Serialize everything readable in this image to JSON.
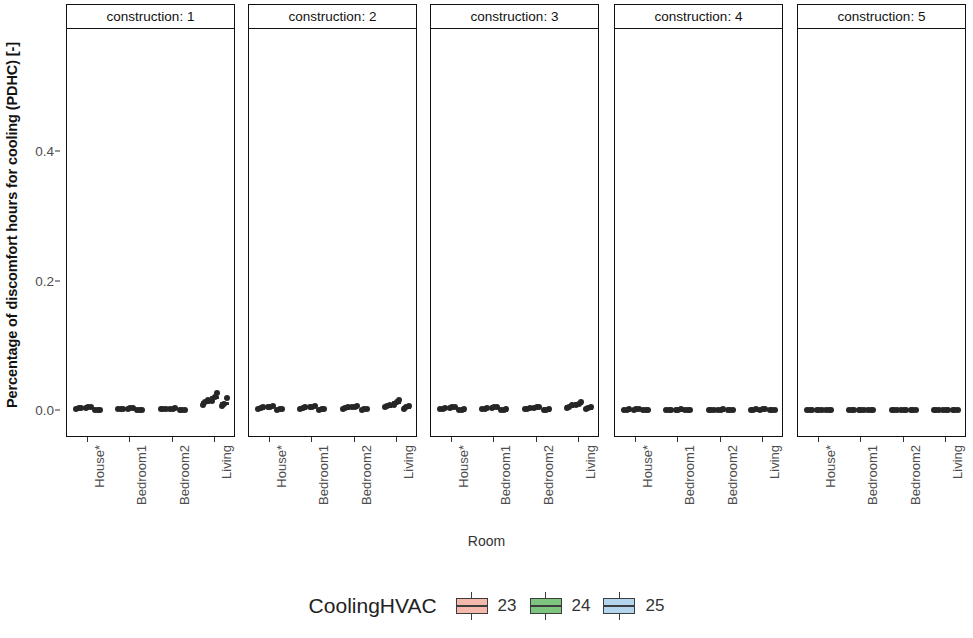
{
  "chart_data": {
    "type": "scatter",
    "title": "",
    "xlabel": "Room",
    "ylabel": "Percentage of discomfort hours for cooling (PDHC) [-]",
    "ylim": [
      -0.02,
      0.52
    ],
    "yticks": [
      0.0,
      0.2,
      0.4
    ],
    "ytick_labels": [
      "0.0",
      "0.2",
      "0.4"
    ],
    "categories": [
      "House*",
      "Bedroom1",
      "Bedroom2",
      "Living"
    ],
    "grid": false,
    "facet_variable": "construction",
    "facet_labels": [
      "construction: 1",
      "construction: 2",
      "construction: 3",
      "construction: 4",
      "construction: 5"
    ],
    "legend": {
      "title": "CoolingHVAC",
      "position": "bottom",
      "entries": [
        {
          "label": "23",
          "color": "#f4b8ac"
        },
        {
          "label": "24",
          "color": "#7dc47f"
        },
        {
          "label": "25",
          "color": "#b3d5ee"
        }
      ]
    },
    "panels": [
      {
        "facet": "construction: 1",
        "groups": [
          {
            "category": "House*",
            "series": [
              {
                "name": "23",
                "values": [
                  0.002,
                  0.003,
                  0.003
                ]
              },
              {
                "name": "24",
                "values": [
                  0.003,
                  0.004,
                  0.004
                ]
              },
              {
                "name": "25",
                "values": [
                  0.0,
                  0.0,
                  0.0
                ]
              }
            ]
          },
          {
            "category": "Bedroom1",
            "series": [
              {
                "name": "23",
                "values": [
                  0.001,
                  0.002,
                  0.002
                ]
              },
              {
                "name": "24",
                "values": [
                  0.002,
                  0.003,
                  0.003
                ]
              },
              {
                "name": "25",
                "values": [
                  0.0,
                  0.0,
                  0.0
                ]
              }
            ]
          },
          {
            "category": "Bedroom2",
            "series": [
              {
                "name": "23",
                "values": [
                  0.001,
                  0.001,
                  0.002
                ]
              },
              {
                "name": "24",
                "values": [
                  0.002,
                  0.002,
                  0.003
                ]
              },
              {
                "name": "25",
                "values": [
                  0.0,
                  0.0,
                  0.0
                ]
              }
            ]
          },
          {
            "category": "Living",
            "series": [
              {
                "name": "23",
                "values": [
                  0.008,
                  0.012,
                  0.016
                ]
              },
              {
                "name": "24",
                "values": [
                  0.014,
                  0.02,
                  0.026
                ]
              },
              {
                "name": "25",
                "values": [
                  0.006,
                  0.01,
                  0.018
                ]
              }
            ]
          }
        ]
      },
      {
        "facet": "construction: 2",
        "groups": [
          {
            "category": "House*",
            "series": [
              {
                "name": "23",
                "values": [
                  0.002,
                  0.003,
                  0.004
                ]
              },
              {
                "name": "24",
                "values": [
                  0.004,
                  0.005,
                  0.006
                ]
              },
              {
                "name": "25",
                "values": [
                  0.0,
                  0.001,
                  0.001
                ]
              }
            ]
          },
          {
            "category": "Bedroom1",
            "series": [
              {
                "name": "23",
                "values": [
                  0.002,
                  0.003,
                  0.004
                ]
              },
              {
                "name": "24",
                "values": [
                  0.004,
                  0.005,
                  0.006
                ]
              },
              {
                "name": "25",
                "values": [
                  0.0,
                  0.001,
                  0.001
                ]
              }
            ]
          },
          {
            "category": "Bedroom2",
            "series": [
              {
                "name": "23",
                "values": [
                  0.002,
                  0.003,
                  0.004
                ]
              },
              {
                "name": "24",
                "values": [
                  0.004,
                  0.005,
                  0.006
                ]
              },
              {
                "name": "25",
                "values": [
                  0.0,
                  0.001,
                  0.001
                ]
              }
            ]
          },
          {
            "category": "Living",
            "series": [
              {
                "name": "23",
                "values": [
                  0.004,
                  0.006,
                  0.008
                ]
              },
              {
                "name": "24",
                "values": [
                  0.008,
                  0.012,
                  0.016
                ]
              },
              {
                "name": "25",
                "values": [
                  0.002,
                  0.004,
                  0.006
                ]
              }
            ]
          }
        ]
      },
      {
        "facet": "construction: 3",
        "groups": [
          {
            "category": "House*",
            "series": [
              {
                "name": "23",
                "values": [
                  0.001,
                  0.002,
                  0.003
                ]
              },
              {
                "name": "24",
                "values": [
                  0.003,
                  0.004,
                  0.004
                ]
              },
              {
                "name": "25",
                "values": [
                  0.0,
                  0.0,
                  0.001
                ]
              }
            ]
          },
          {
            "category": "Bedroom1",
            "series": [
              {
                "name": "23",
                "values": [
                  0.001,
                  0.002,
                  0.003
                ]
              },
              {
                "name": "24",
                "values": [
                  0.003,
                  0.004,
                  0.004
                ]
              },
              {
                "name": "25",
                "values": [
                  0.0,
                  0.0,
                  0.001
                ]
              }
            ]
          },
          {
            "category": "Bedroom2",
            "series": [
              {
                "name": "23",
                "values": [
                  0.001,
                  0.002,
                  0.003
                ]
              },
              {
                "name": "24",
                "values": [
                  0.003,
                  0.004,
                  0.004
                ]
              },
              {
                "name": "25",
                "values": [
                  0.0,
                  0.0,
                  0.001
                ]
              }
            ]
          },
          {
            "category": "Living",
            "series": [
              {
                "name": "23",
                "values": [
                  0.003,
                  0.005,
                  0.007
                ]
              },
              {
                "name": "24",
                "values": [
                  0.007,
                  0.01,
                  0.013
                ]
              },
              {
                "name": "25",
                "values": [
                  0.001,
                  0.003,
                  0.005
                ]
              }
            ]
          }
        ]
      },
      {
        "facet": "construction: 4",
        "groups": [
          {
            "category": "House*",
            "series": [
              {
                "name": "23",
                "values": [
                  0.0,
                  0.0,
                  0.001
                ]
              },
              {
                "name": "24",
                "values": [
                  0.0,
                  0.001,
                  0.001
                ]
              },
              {
                "name": "25",
                "values": [
                  0.0,
                  0.0,
                  0.0
                ]
              }
            ]
          },
          {
            "category": "Bedroom1",
            "series": [
              {
                "name": "23",
                "values": [
                  0.0,
                  0.0,
                  0.0
                ]
              },
              {
                "name": "24",
                "values": [
                  0.0,
                  0.0,
                  0.001
                ]
              },
              {
                "name": "25",
                "values": [
                  0.0,
                  0.0,
                  0.0
                ]
              }
            ]
          },
          {
            "category": "Bedroom2",
            "series": [
              {
                "name": "23",
                "values": [
                  0.0,
                  0.0,
                  0.0
                ]
              },
              {
                "name": "24",
                "values": [
                  0.0,
                  0.0,
                  0.001
                ]
              },
              {
                "name": "25",
                "values": [
                  0.0,
                  0.0,
                  0.0
                ]
              }
            ]
          },
          {
            "category": "Living",
            "series": [
              {
                "name": "23",
                "values": [
                  0.0,
                  0.0,
                  0.001
                ]
              },
              {
                "name": "24",
                "values": [
                  0.0,
                  0.001,
                  0.001
                ]
              },
              {
                "name": "25",
                "values": [
                  0.0,
                  0.0,
                  0.0
                ]
              }
            ]
          }
        ]
      },
      {
        "facet": "construction: 5",
        "groups": [
          {
            "category": "House*",
            "series": [
              {
                "name": "23",
                "values": [
                  0.0,
                  0.0,
                  0.0
                ]
              },
              {
                "name": "24",
                "values": [
                  0.0,
                  0.0,
                  0.0
                ]
              },
              {
                "name": "25",
                "values": [
                  0.0,
                  0.0,
                  0.0
                ]
              }
            ]
          },
          {
            "category": "Bedroom1",
            "series": [
              {
                "name": "23",
                "values": [
                  0.0,
                  0.0,
                  0.0
                ]
              },
              {
                "name": "24",
                "values": [
                  0.0,
                  0.0,
                  0.0
                ]
              },
              {
                "name": "25",
                "values": [
                  0.0,
                  0.0,
                  0.0
                ]
              }
            ]
          },
          {
            "category": "Bedroom2",
            "series": [
              {
                "name": "23",
                "values": [
                  0.0,
                  0.0,
                  0.0
                ]
              },
              {
                "name": "24",
                "values": [
                  0.0,
                  0.0,
                  0.0
                ]
              },
              {
                "name": "25",
                "values": [
                  0.0,
                  0.0,
                  0.0
                ]
              }
            ]
          },
          {
            "category": "Living",
            "series": [
              {
                "name": "23",
                "values": [
                  0.0,
                  0.0,
                  0.0
                ]
              },
              {
                "name": "24",
                "values": [
                  0.0,
                  0.0,
                  0.0
                ]
              },
              {
                "name": "25",
                "values": [
                  0.0,
                  0.0,
                  0.0
                ]
              }
            ]
          }
        ]
      }
    ]
  },
  "layout": {
    "panel_left_edges": [
      66,
      248,
      430,
      614,
      797
    ],
    "panel_width": 169,
    "strip_height": 25,
    "plot_top": 29,
    "plot_height": 408,
    "y_zero_px": 410,
    "y_unit_px": 647
  }
}
